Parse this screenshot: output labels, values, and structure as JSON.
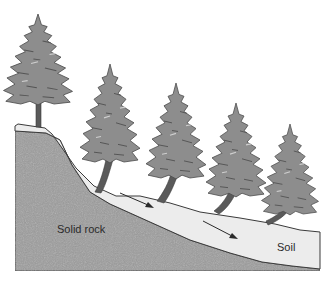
{
  "diagram": {
    "labels": {
      "rock": "Solid rock",
      "soil": "Soil"
    },
    "elements": {
      "trees": 5,
      "arrows": 2
    },
    "colors": {
      "rock": "#9a9a9a",
      "soil": "#ececec",
      "tree": "#8a8a8a",
      "outline": "#3a3a3a",
      "background": "#ffffff"
    }
  }
}
